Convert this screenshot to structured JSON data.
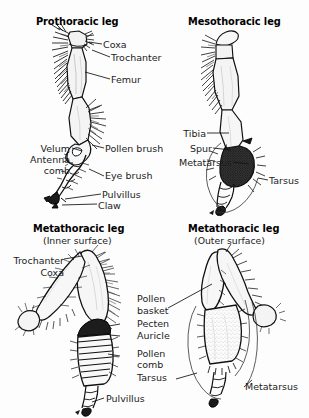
{
  "figure": {
    "kind": "scientific-illustration",
    "background_color": "#fdfdfd",
    "ink_color": "#1a1a1a",
    "panels": [
      {
        "id": "prothoracic",
        "title": "Prothoracic leg",
        "subtitle": "",
        "labels": [
          "Coxa",
          "Trochanter",
          "Femur",
          "Velum",
          "Antenna",
          "comb",
          "Pollen brush",
          "Eye brush",
          "Pulvillus",
          "Claw"
        ]
      },
      {
        "id": "mesothoracic",
        "title": "Mesothoracic leg",
        "subtitle": "",
        "labels": [
          "Tibia",
          "Spur",
          "Metatarsus",
          "Tarsus"
        ]
      },
      {
        "id": "metathoracic-inner",
        "title": "Metathoracic leg",
        "subtitle": "(Inner surface)",
        "labels": [
          "Trochanter",
          "Coxa",
          "Pecten",
          "Auricle",
          "Pollen",
          "comb",
          "Pulvillus"
        ]
      },
      {
        "id": "metathoracic-outer",
        "title": "Metathoracic leg",
        "subtitle": "(Outer surface)",
        "labels": [
          "Pollen",
          "basket",
          "Tarsus",
          "Metatarsus"
        ]
      }
    ]
  },
  "titles": {
    "prothoracic": "Prothoracic leg",
    "mesothoracic": "Mesothoracic leg",
    "metathoracic_inner": "Metathoracic leg",
    "metathoracic_inner_sub": "(Inner surface)",
    "metathoracic_outer": "Metathoracic leg",
    "metathoracic_outer_sub": "(Outer surface)"
  },
  "labels": {
    "coxa": "Coxa",
    "trochanter": "Trochanter",
    "femur": "Femur",
    "velum": "Velum",
    "antenna": "Antenna",
    "comb": "comb",
    "pollen_brush": "Pollen brush",
    "eye_brush": "Eye brush",
    "pulvillus": "Pulvillus",
    "claw": "Claw",
    "tibia": "Tibia",
    "spur": "Spur",
    "metatarsus": "Metatarsus",
    "tarsus": "Tarsus",
    "meta_trochanter": "Trochanter",
    "meta_coxa": "Coxa",
    "pecten": "Pecten",
    "auricle": "Auricle",
    "pollen_word": "Pollen",
    "comb_word": "comb",
    "meta_pulvillus": "Pulvillus",
    "pollen_word2": "Pollen",
    "basket_word": "basket",
    "meta_tarsus": "Tarsus",
    "meta_metatarsus": "Metatarsus"
  }
}
